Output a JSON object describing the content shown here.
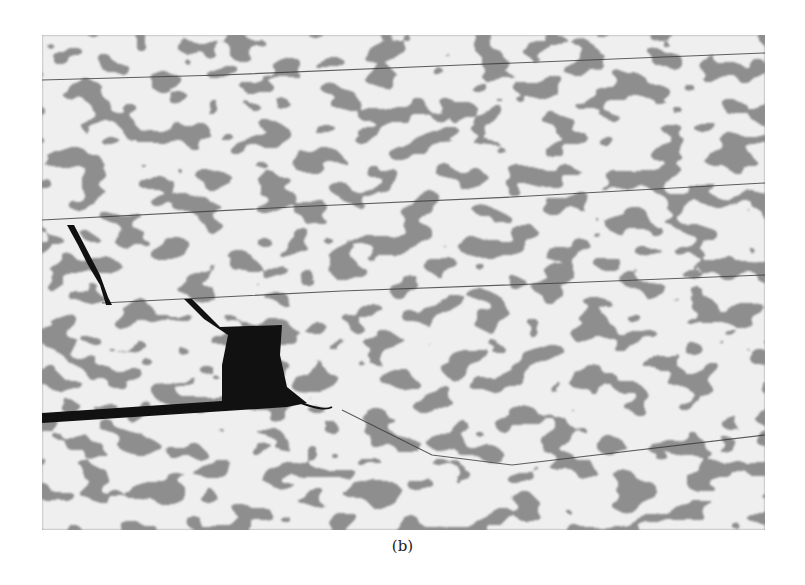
{
  "figure": {
    "caption": "(b)",
    "colors": {
      "dark_phase": "#8e8e8e",
      "light_phase": "#efefef",
      "crack": "#111111",
      "background": "#ffffff"
    }
  }
}
